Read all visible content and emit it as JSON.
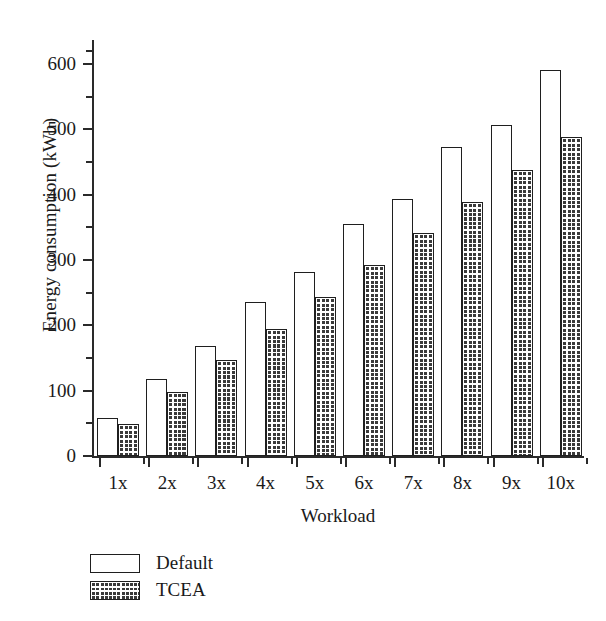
{
  "chart_data": {
    "type": "bar",
    "title": "",
    "xlabel": "Workload",
    "ylabel": "Energy consumption (kWh)",
    "categories": [
      "1x",
      "2x",
      "3x",
      "4x",
      "5x",
      "6x",
      "7x",
      "8x",
      "9x",
      "10x"
    ],
    "series": [
      {
        "name": "Default",
        "fill": "white-open",
        "color": "#ffffff",
        "edge_color": "#1f1f1f",
        "values": [
          58,
          118,
          169,
          236,
          282,
          355,
          394,
          473,
          507,
          591
        ]
      },
      {
        "name": "TCEA",
        "fill": "cross-hatch",
        "color": "#3a3a3a",
        "edge_color": "#1f1f1f",
        "values": [
          49,
          98,
          147,
          195,
          244,
          292,
          341,
          389,
          438,
          488
        ]
      }
    ],
    "ylim": [
      0,
      640
    ],
    "ytick_values": [
      0,
      100,
      200,
      300,
      400,
      500,
      600
    ],
    "ytick_labels": [
      "0",
      "100",
      "200",
      "300",
      "400",
      "500",
      "600"
    ],
    "yminor_values": [
      50,
      150,
      250,
      350,
      450,
      550,
      620
    ],
    "grid": false,
    "legend_position": "below-left",
    "legend_entries": [
      "Default",
      "TCEA"
    ]
  }
}
